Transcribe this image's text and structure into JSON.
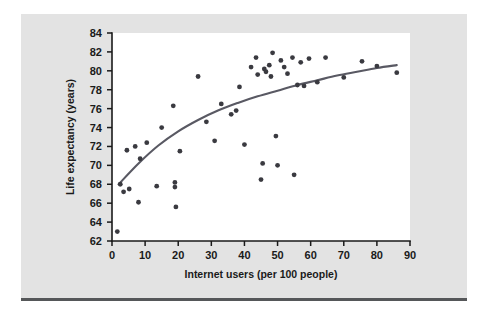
{
  "figure": {
    "background_color": "#e3e3e3",
    "plot_background_color": "#ffffff",
    "rule_color": "#555759"
  },
  "chart_data": {
    "type": "scatter",
    "title": "",
    "subtitle": "",
    "xlabel": "Internet users (per 100 people)",
    "ylabel": "Life expectancy (years)",
    "xlim": [
      0,
      90
    ],
    "ylim": [
      62,
      84
    ],
    "xticks": [
      0,
      10,
      20,
      30,
      40,
      50,
      60,
      70,
      80,
      90
    ],
    "yticks": [
      62,
      64,
      66,
      68,
      70,
      72,
      74,
      76,
      78,
      80,
      82,
      84
    ],
    "xtick_labels": [
      "0",
      "10",
      "20",
      "30",
      "40",
      "50",
      "60",
      "70",
      "80",
      "90"
    ],
    "ytick_labels": [
      "62",
      "64",
      "66",
      "68",
      "70",
      "72",
      "74",
      "76",
      "78",
      "80",
      "82",
      "84"
    ],
    "grid": false,
    "legend": false,
    "legend_position": "none",
    "point_color": "#3a3a40",
    "point_size": 3,
    "series": [
      {
        "name": "Countries",
        "marker": "circle",
        "points": [
          [
            1.6,
            63.0
          ],
          [
            2.5,
            68.0
          ],
          [
            3.5,
            67.2
          ],
          [
            4.5,
            71.6
          ],
          [
            5.2,
            67.5
          ],
          [
            7.0,
            72.0
          ],
          [
            8.0,
            66.1
          ],
          [
            8.5,
            70.7
          ],
          [
            10.5,
            72.4
          ],
          [
            13.5,
            67.8
          ],
          [
            15.0,
            74.0
          ],
          [
            18.5,
            76.3
          ],
          [
            19.0,
            68.2
          ],
          [
            19.0,
            67.7
          ],
          [
            19.3,
            65.6
          ],
          [
            20.5,
            71.5
          ],
          [
            26.0,
            79.4
          ],
          [
            28.5,
            74.6
          ],
          [
            31.0,
            72.6
          ],
          [
            33.0,
            76.5
          ],
          [
            36.0,
            75.4
          ],
          [
            37.5,
            75.8
          ],
          [
            38.5,
            78.3
          ],
          [
            40.0,
            72.2
          ],
          [
            42.0,
            80.4
          ],
          [
            43.5,
            81.4
          ],
          [
            44.0,
            79.6
          ],
          [
            45.0,
            68.5
          ],
          [
            45.5,
            70.2
          ],
          [
            46.0,
            80.2
          ],
          [
            46.5,
            79.9
          ],
          [
            47.5,
            80.6
          ],
          [
            48.0,
            79.4
          ],
          [
            48.5,
            81.9
          ],
          [
            49.5,
            73.1
          ],
          [
            50.0,
            70.0
          ],
          [
            51.0,
            81.1
          ],
          [
            52.0,
            80.4
          ],
          [
            53.0,
            79.7
          ],
          [
            54.5,
            81.4
          ],
          [
            55.0,
            69.0
          ],
          [
            56.0,
            78.5
          ],
          [
            57.0,
            80.9
          ],
          [
            58.0,
            78.4
          ],
          [
            59.5,
            81.3
          ],
          [
            62.0,
            78.8
          ],
          [
            64.5,
            81.4
          ],
          [
            70.0,
            79.3
          ],
          [
            75.5,
            81.0
          ],
          [
            80.0,
            80.5
          ],
          [
            86.0,
            79.8
          ]
        ]
      }
    ],
    "trend": {
      "name": "Fitted curve",
      "color": "#595963",
      "points": [
        [
          2.0,
          68.0
        ],
        [
          8.0,
          70.2
        ],
        [
          14.0,
          72.1
        ],
        [
          20.0,
          73.6
        ],
        [
          26.0,
          74.8
        ],
        [
          32.0,
          75.8
        ],
        [
          38.0,
          76.6
        ],
        [
          44.0,
          77.3
        ],
        [
          50.0,
          77.9
        ],
        [
          56.0,
          78.5
        ],
        [
          62.0,
          79.0
        ],
        [
          68.0,
          79.5
        ],
        [
          74.0,
          79.9
        ],
        [
          80.0,
          80.3
        ],
        [
          86.0,
          80.6
        ]
      ]
    }
  }
}
